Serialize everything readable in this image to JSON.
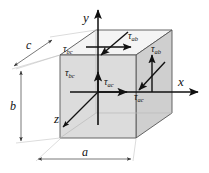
{
  "figure": {
    "type": "stress-element-diagram"
  },
  "axes": [
    {
      "name": "y-axis",
      "label": "y",
      "direction": "up"
    },
    {
      "name": "x-axis",
      "label": "x",
      "direction": "right"
    },
    {
      "name": "z-axis",
      "label": "z",
      "direction": "down-left"
    }
  ],
  "dimensions": [
    {
      "name": "depth",
      "label": "c",
      "orientation": "diagonal-up-right"
    },
    {
      "name": "height",
      "label": "b",
      "orientation": "vertical"
    },
    {
      "name": "width",
      "label": "a",
      "orientation": "horizontal"
    }
  ],
  "stresses": [
    {
      "face": "top",
      "label": "τ",
      "sub": "ab",
      "arrow": "right"
    },
    {
      "face": "top",
      "label": "τ",
      "sub": "bc",
      "arrow": "down-right-diagonal"
    },
    {
      "face": "front",
      "label": "τ",
      "sub": "bc",
      "arrow": "up"
    },
    {
      "face": "front",
      "label": "τ",
      "sub": "ac",
      "arrow": "right"
    },
    {
      "face": "right",
      "label": "τ",
      "sub": "ab",
      "arrow": "up"
    },
    {
      "face": "right",
      "label": "τ",
      "sub": "ac",
      "arrow": "down-left-diagonal"
    }
  ],
  "colors": {
    "face_front": "#d9d9d9",
    "face_right": "#cfcfcf",
    "face_top": "#f2f2f2",
    "outline": "#555555",
    "arrow": "#111111",
    "text": "#111111"
  }
}
